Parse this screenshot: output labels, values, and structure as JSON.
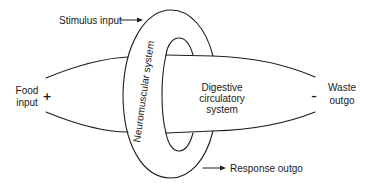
{
  "diagram": {
    "type": "conceptual-systems-diagram",
    "nodes": {
      "ring": {
        "label": "Neuromuscular system"
      },
      "tube": {
        "label_lines": [
          "Digestive",
          "circulatory",
          "system"
        ]
      }
    },
    "inputs": {
      "stimulus": {
        "label": "Stimulus input"
      },
      "food": {
        "label_lines": [
          "Food",
          "input"
        ],
        "sign": "+"
      }
    },
    "outputs": {
      "response": {
        "label": "Response outgo"
      },
      "waste": {
        "label_lines": [
          "Waste",
          "outgo"
        ],
        "sign": "–"
      }
    },
    "colors": {
      "line": "#1e1e1e",
      "text": "#1a1a1a",
      "background": "#ffffff"
    }
  }
}
